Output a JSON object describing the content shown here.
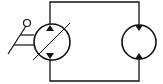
{
  "diagram": {
    "title": "Hydraulic closed-loop circuit",
    "stroke_color": "#111111",
    "background": "#ffffff",
    "components": [
      {
        "id": "pump",
        "type": "variable-displacement-pump",
        "control": "manual-lever",
        "flow_direction": "bidirectional"
      },
      {
        "id": "motor",
        "type": "hydraulic-motor",
        "flow_direction": "bidirectional"
      }
    ],
    "connections": [
      {
        "from": "pump.top",
        "to": "motor.top",
        "label": "line-A"
      },
      {
        "from": "pump.bottom",
        "to": "motor.bottom",
        "label": "line-B"
      }
    ]
  }
}
